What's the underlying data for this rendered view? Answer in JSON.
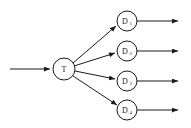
{
  "diagram": {
    "background_color": "#ffffff",
    "stroke_color": "#1a1a1a",
    "input": {
      "arrow_name": "input-arrow",
      "label": ""
    },
    "source_node": {
      "id": "T",
      "label": "T",
      "subscript": "",
      "cx": 64,
      "cy": 69,
      "r": 11
    },
    "target_nodes": [
      {
        "id": "D1",
        "label": "D",
        "subscript": "1",
        "cx": 127,
        "cy": 21,
        "r": 10
      },
      {
        "id": "D2",
        "label": "D",
        "subscript": "2",
        "cx": 127,
        "cy": 51,
        "r": 10
      },
      {
        "id": "D3",
        "label": "D",
        "subscript": "3",
        "cx": 127,
        "cy": 81,
        "r": 10
      },
      {
        "id": "D4",
        "label": "D",
        "subscript": "4",
        "cx": 127,
        "cy": 110,
        "r": 10
      }
    ],
    "output_arrows": [
      {
        "name": "output-arrow-1",
        "label": ""
      },
      {
        "name": "output-arrow-2",
        "label": ""
      },
      {
        "name": "output-arrow-3",
        "label": ""
      },
      {
        "name": "output-arrow-4",
        "label": ""
      }
    ]
  }
}
